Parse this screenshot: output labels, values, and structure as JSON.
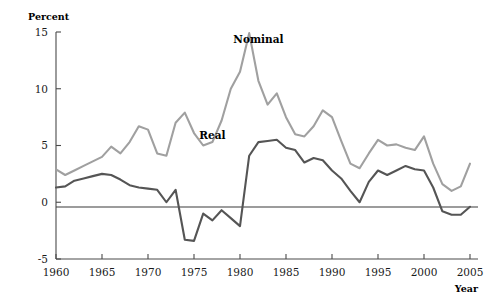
{
  "chart_data": {
    "type": "line",
    "title": "",
    "subtitle": "",
    "xlabel": "Year",
    "ylabel": "Percent",
    "xlim": [
      1960,
      2005
    ],
    "ylim": [
      -5,
      15
    ],
    "grid": false,
    "legend_position": "inline-annotation",
    "xticks": [
      1960,
      1965,
      1970,
      1975,
      1980,
      1985,
      1990,
      1995,
      2000,
      2005
    ],
    "xtick_labels": [
      "1960",
      "1965",
      "1970",
      "1975",
      "1980",
      "1985",
      "1990",
      "1995",
      "2000",
      "2005"
    ],
    "yticks": [
      -5,
      0,
      5,
      10,
      15
    ],
    "ytick_labels": [
      "-5",
      "0",
      "5",
      "10",
      "15"
    ],
    "x": [
      1960,
      1961,
      1962,
      1963,
      1964,
      1965,
      1966,
      1967,
      1968,
      1969,
      1970,
      1971,
      1972,
      1973,
      1974,
      1975,
      1976,
      1977,
      1978,
      1979,
      1980,
      1981,
      1982,
      1983,
      1984,
      1985,
      1986,
      1987,
      1988,
      1989,
      1990,
      1991,
      1992,
      1993,
      1994,
      1995,
      1996,
      1997,
      1998,
      1999,
      2000,
      2001,
      2002,
      2003,
      2004,
      2005
    ],
    "series": [
      {
        "name": "Nominal",
        "color": "#a0a0a0",
        "label_x": 1982.0,
        "label_y": 14.0,
        "values": [
          2.9,
          2.4,
          2.8,
          3.2,
          3.6,
          4.0,
          4.9,
          4.3,
          5.3,
          6.7,
          6.4,
          4.3,
          4.1,
          7.0,
          7.9,
          6.1,
          5.0,
          5.3,
          7.2,
          10.0,
          11.5,
          14.9,
          10.7,
          8.6,
          9.6,
          7.5,
          6.0,
          5.8,
          6.7,
          8.1,
          7.5,
          5.4,
          3.4,
          3.0,
          4.3,
          5.5,
          5.0,
          5.1,
          4.8,
          4.6,
          5.8,
          3.4,
          1.6,
          1.0,
          1.4,
          3.4
        ]
      },
      {
        "name": "Real",
        "color": "#555555",
        "label_x": 1977.0,
        "label_y": 5.6,
        "values": [
          1.3,
          1.4,
          1.9,
          2.1,
          2.3,
          2.5,
          2.4,
          2.0,
          1.5,
          1.3,
          1.2,
          1.1,
          0.0,
          1.1,
          -3.3,
          -3.4,
          -1.0,
          -1.6,
          -0.7,
          -1.4,
          -2.1,
          4.1,
          5.3,
          5.4,
          5.5,
          4.8,
          4.6,
          3.5,
          3.9,
          3.7,
          2.8,
          2.1,
          1.0,
          0.0,
          1.8,
          2.8,
          2.4,
          2.8,
          3.2,
          2.9,
          2.8,
          1.3,
          -0.8,
          -1.1,
          -1.1,
          -0.4
        ]
      }
    ]
  },
  "axis": {
    "y_title": "Percent",
    "x_title": "Year"
  }
}
